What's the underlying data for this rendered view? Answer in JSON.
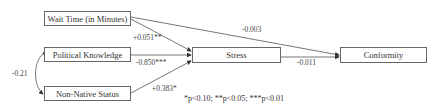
{
  "nodes": {
    "wait_time": "Wait Time (in Minutes)",
    "political_knowledge": "Political Knowledge",
    "non_native": "Non-Native Status",
    "stress": "Stress",
    "conformity": "Conformity"
  },
  "edges": {
    "wait_to_stress": "+0.051**",
    "pk_to_stress": "-0.850***",
    "nn_to_stress": "+0.383*",
    "wait_to_conformity": "-0.003",
    "stress_to_conformity": "-0.011",
    "pk_nn_correlation": "-0.21"
  },
  "footnote": "*p<0.10; **p<0.05; ***p<0.01"
}
